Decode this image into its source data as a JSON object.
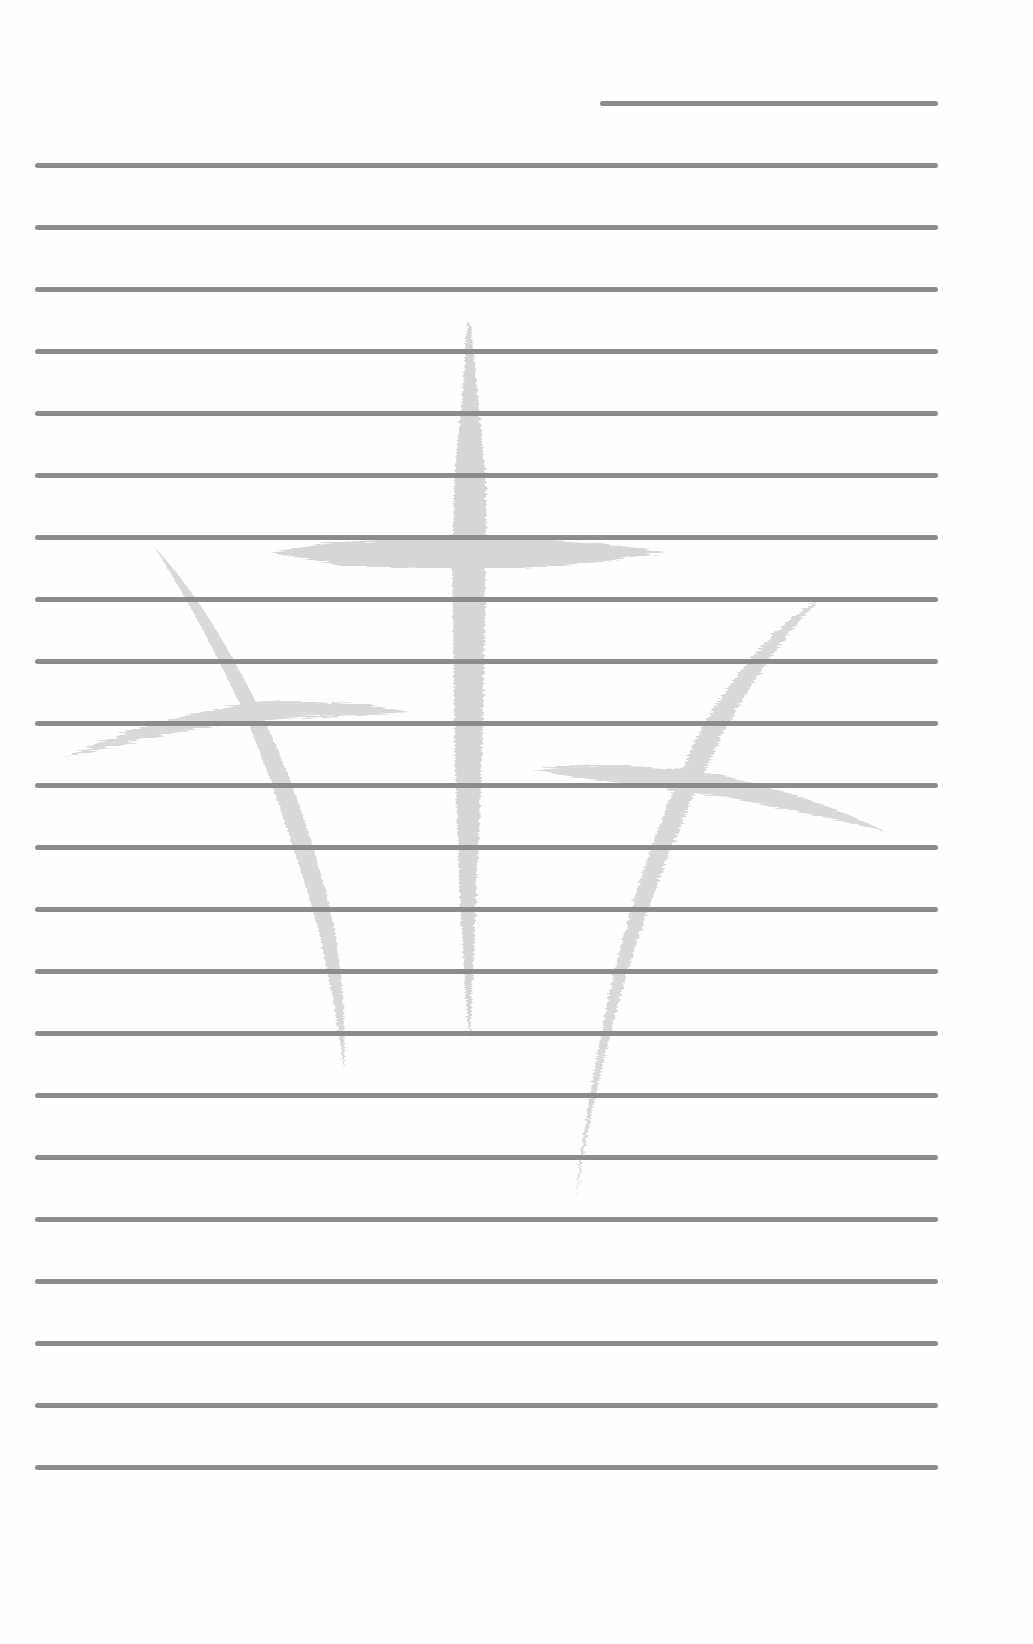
{
  "document": {
    "type": "lined-paper",
    "background_color": "#fefefe",
    "line_color": "#8c8c8c",
    "watermark_color": "#d6d6d6",
    "watermark": "three-crosses-icon",
    "title_line": {
      "x1": 600,
      "x2": 938,
      "y": 103
    },
    "lines": {
      "x1": 35,
      "x2": 938,
      "y_positions": [
        165,
        227,
        289,
        351,
        413,
        475,
        537,
        599,
        661,
        723,
        785,
        847,
        909,
        971,
        1033,
        1095,
        1157,
        1219,
        1281,
        1343,
        1405,
        1467
      ]
    }
  }
}
